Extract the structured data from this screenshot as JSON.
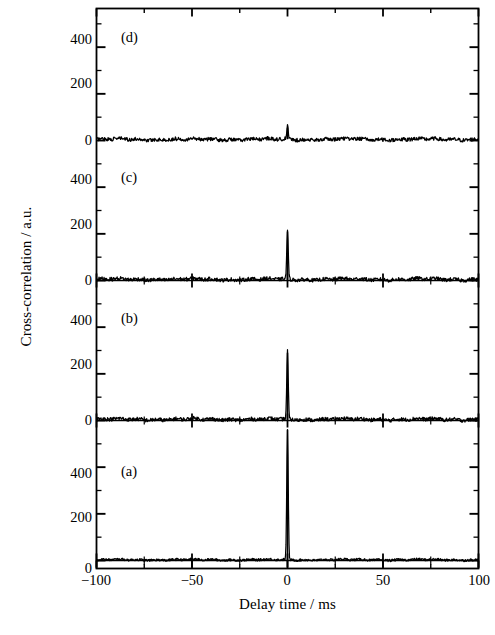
{
  "figure": {
    "axis_label_x": "Delay time / ms",
    "axis_label_y": "Cross-correlation / a.u.",
    "panel_labels": [
      "(a)",
      "(b)",
      "(c)",
      "(d)"
    ],
    "x_tick_labels": [
      "−100",
      "−50",
      "0",
      "50",
      "100"
    ],
    "y_tick_labels": [
      "0",
      "200",
      "400"
    ],
    "line_color": "#000000",
    "background_color": "#ffffff"
  },
  "chart_data": {
    "type": "line",
    "title": "",
    "xlabel": "Delay time / ms",
    "ylabel": "Cross-correlation / a.u.",
    "xlim": [
      -100,
      100
    ],
    "ylim": [
      -40,
      560
    ],
    "xticks": [
      -100,
      -50,
      0,
      50,
      100
    ],
    "xticks_minor": [
      -75,
      -25,
      25,
      75
    ],
    "yticks": [
      0,
      200,
      400
    ],
    "yticks_minor": [
      100,
      300,
      500
    ],
    "grid": false,
    "legend": "none",
    "panels": [
      {
        "label": "(d)",
        "order_from_top": 1,
        "baseline_level": 5,
        "noise_amplitude": 8,
        "peak": {
          "x": 0,
          "height": 55,
          "width_ms": 0.9,
          "clipped": false
        },
        "note": "flat noisy baseline, very small residual peak at zero delay"
      },
      {
        "label": "(c)",
        "order_from_top": 2,
        "baseline_level": 5,
        "noise_amplitude": 8,
        "peak": {
          "x": 0,
          "height": 210,
          "width_ms": 0.9,
          "clipped": false
        },
        "note": "sharp peak at zero delay reaching about 210 a.u."
      },
      {
        "label": "(b)",
        "order_from_top": 3,
        "baseline_level": 5,
        "noise_amplitude": 8,
        "peak": {
          "x": 0,
          "height": 290,
          "width_ms": 0.9,
          "clipped": false
        },
        "note": "sharp peak at zero delay reaching about 290 a.u."
      },
      {
        "label": "(a)",
        "order_from_top": 4,
        "baseline_level": 3,
        "noise_amplitude": 5,
        "peak": {
          "x": 0,
          "height": 560,
          "width_ms": 0.9,
          "clipped": true
        },
        "note": "very large peak at zero delay, clipped at top of panel (>560 a.u.)"
      }
    ],
    "series": [
      {
        "name": "(a)",
        "x": [
          -100,
          -90,
          -80,
          -70,
          -60,
          -50,
          -40,
          -30,
          -20,
          -10,
          -2,
          -0.6,
          0,
          0.6,
          2,
          10,
          20,
          30,
          40,
          50,
          60,
          70,
          80,
          90,
          100
        ],
        "values": [
          4,
          3,
          5,
          2,
          4,
          3,
          5,
          3,
          4,
          2,
          4,
          20,
          560,
          20,
          4,
          3,
          4,
          2,
          5,
          3,
          4,
          3,
          5,
          2,
          4
        ]
      },
      {
        "name": "(b)",
        "x": [
          -100,
          -90,
          -80,
          -70,
          -60,
          -50,
          -40,
          -30,
          -20,
          -10,
          -2,
          -0.6,
          0,
          0.6,
          2,
          10,
          20,
          30,
          40,
          50,
          60,
          70,
          80,
          90,
          100
        ],
        "values": [
          6,
          4,
          8,
          3,
          7,
          5,
          9,
          4,
          6,
          5,
          7,
          30,
          290,
          30,
          6,
          5,
          8,
          4,
          7,
          5,
          6,
          4,
          8,
          5,
          6
        ]
      },
      {
        "name": "(c)",
        "x": [
          -100,
          -90,
          -80,
          -70,
          -60,
          -50,
          -40,
          -30,
          -20,
          -10,
          -2,
          -0.6,
          0,
          0.6,
          2,
          10,
          20,
          30,
          40,
          50,
          60,
          70,
          80,
          90,
          100
        ],
        "values": [
          6,
          5,
          9,
          4,
          7,
          6,
          8,
          5,
          7,
          4,
          8,
          45,
          210,
          45,
          7,
          6,
          9,
          5,
          7,
          6,
          8,
          5,
          7,
          6,
          7
        ]
      },
      {
        "name": "(d)",
        "x": [
          -100,
          -90,
          -80,
          -70,
          -60,
          -50,
          -40,
          -30,
          -20,
          -10,
          -2,
          -0.6,
          0,
          0.6,
          2,
          10,
          20,
          30,
          40,
          50,
          60,
          70,
          80,
          90,
          100
        ],
        "values": [
          6,
          5,
          8,
          4,
          7,
          5,
          9,
          4,
          8,
          5,
          7,
          25,
          55,
          25,
          7,
          5,
          9,
          4,
          8,
          6,
          7,
          5,
          9,
          4,
          7
        ]
      }
    ]
  }
}
